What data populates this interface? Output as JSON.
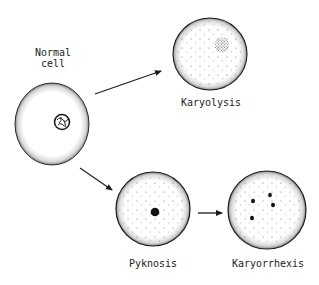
{
  "diagram": {
    "labels": {
      "normal": "Normal\ncell",
      "karyolysis": "Karyolysis",
      "pyknosis": "Pyknosis",
      "karyorrhexis": "Karyorrhexis"
    },
    "colors": {
      "ink": "#1a1a1a",
      "background": "#ffffff"
    },
    "cells": [
      {
        "id": "normal",
        "nucleus": "normal-textured"
      },
      {
        "id": "karyolysis",
        "nucleus": "faded-stippled"
      },
      {
        "id": "pyknosis",
        "nucleus": "single-condensed-dot"
      },
      {
        "id": "karyorrhexis",
        "nucleus": "four-fragments"
      }
    ],
    "arrows": [
      {
        "from": "normal",
        "to": "karyolysis"
      },
      {
        "from": "normal",
        "to": "pyknosis"
      },
      {
        "from": "pyknosis",
        "to": "karyorrhexis"
      }
    ]
  }
}
